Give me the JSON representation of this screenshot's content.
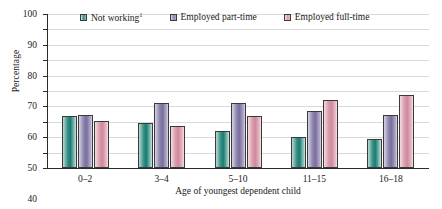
{
  "chart_data": {
    "type": "bar",
    "title": "",
    "xlabel": "Age of youngest dependent child",
    "ylabel": "Percentage",
    "ylim": [
      0,
      100
    ],
    "ytick_step": 10,
    "grid": true,
    "legend_position": "top",
    "categories": [
      "0–2",
      "3–4",
      "5–10",
      "11–15",
      "16–18"
    ],
    "series": [
      {
        "name": "Not working",
        "footnote": "1",
        "color": "#2e8d82",
        "values": [
          33.5,
          29.5,
          24,
          20,
          19
        ]
      },
      {
        "name": "Employed part-time",
        "footnote": "",
        "color": "#8d84ad",
        "values": [
          34.5,
          42.5,
          42,
          37,
          34.5
        ]
      },
      {
        "name": "Employed full-time",
        "footnote": "",
        "color": "#d99aaa",
        "values": [
          30.5,
          27,
          34,
          44,
          47.5
        ]
      }
    ],
    "ytick_labels": [
      "0",
      "10",
      "20",
      "30",
      "40",
      "50",
      "60",
      "70",
      "80",
      "90",
      "100"
    ]
  },
  "legend": {
    "items": [
      {
        "label": "Not working",
        "sup": "1"
      },
      {
        "label": "Employed part-time",
        "sup": ""
      },
      {
        "label": "Employed full-time",
        "sup": ""
      }
    ]
  },
  "axes": {
    "y_title": "Percentage",
    "x_title": "Age of youngest dependent child"
  }
}
